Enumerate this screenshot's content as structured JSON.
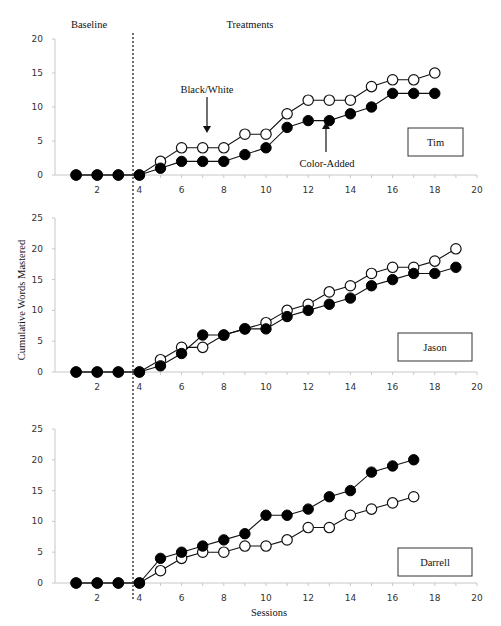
{
  "phase_labels": {
    "baseline": "Baseline",
    "treatments": "Treatments"
  },
  "y_axis_label": "Cumulative Words Mastered",
  "x_axis_label": "Sessions",
  "annotations": {
    "black_white": "Black/White",
    "color_added": "Color-Added"
  },
  "phase_change_after_session": 3.5,
  "colors": {
    "line": "#111111",
    "filled_marker": "#000000",
    "open_marker": "#ffffff",
    "axis": "#c8c8c8"
  },
  "chart_data": [
    {
      "type": "line",
      "title": "Tim",
      "xlabel": "",
      "ylabel": "",
      "xlim": [
        0,
        20
      ],
      "ylim": [
        0,
        20
      ],
      "xticks": [
        2,
        4,
        6,
        8,
        10,
        12,
        14,
        16,
        18,
        20
      ],
      "yticks": [
        0,
        5,
        10,
        15,
        20
      ],
      "grid": false,
      "series": [
        {
          "name": "Black/White",
          "marker": "open",
          "x": [
            1,
            2,
            3,
            4,
            5,
            6,
            7,
            8,
            9,
            10,
            11,
            12,
            13,
            14,
            15,
            16,
            17,
            18
          ],
          "values": [
            0,
            0,
            0,
            0,
            2,
            4,
            4,
            4,
            6,
            6,
            9,
            11,
            11,
            11,
            13,
            14,
            14,
            15
          ]
        },
        {
          "name": "Color-Added",
          "marker": "filled",
          "x": [
            1,
            2,
            3,
            4,
            5,
            6,
            7,
            8,
            9,
            10,
            11,
            12,
            13,
            14,
            15,
            16,
            17,
            18
          ],
          "values": [
            0,
            0,
            0,
            0,
            1,
            2,
            2,
            2,
            3,
            4,
            7,
            8,
            8,
            9,
            10,
            12,
            12,
            12
          ]
        }
      ]
    },
    {
      "type": "line",
      "title": "Jason",
      "xlabel": "",
      "ylabel": "Cumulative Words Mastered",
      "xlim": [
        0,
        20
      ],
      "ylim": [
        0,
        25
      ],
      "xticks": [
        2,
        4,
        6,
        8,
        10,
        12,
        14,
        16,
        18,
        20
      ],
      "yticks": [
        0,
        5,
        10,
        15,
        20,
        25
      ],
      "grid": false,
      "series": [
        {
          "name": "Black/White",
          "marker": "open",
          "x": [
            1,
            2,
            3,
            4,
            5,
            6,
            7,
            8,
            9,
            10,
            11,
            12,
            13,
            14,
            15,
            16,
            17,
            18,
            19
          ],
          "values": [
            0,
            0,
            0,
            0,
            2,
            4,
            4,
            6,
            7,
            8,
            10,
            11,
            13,
            14,
            16,
            17,
            17,
            18,
            20
          ]
        },
        {
          "name": "Color-Added",
          "marker": "filled",
          "x": [
            1,
            2,
            3,
            4,
            5,
            6,
            7,
            8,
            9,
            10,
            11,
            12,
            13,
            14,
            15,
            16,
            17,
            18,
            19
          ],
          "values": [
            0,
            0,
            0,
            0,
            1,
            3,
            6,
            6,
            7,
            7,
            9,
            10,
            11,
            12,
            14,
            15,
            16,
            16,
            17
          ]
        }
      ]
    },
    {
      "type": "line",
      "title": "Darrell",
      "xlabel": "Sessions",
      "ylabel": "",
      "xlim": [
        0,
        20
      ],
      "ylim": [
        0,
        25
      ],
      "xticks": [
        2,
        4,
        6,
        8,
        10,
        12,
        14,
        16,
        18,
        20
      ],
      "yticks": [
        0,
        5,
        10,
        15,
        20,
        25
      ],
      "grid": false,
      "series": [
        {
          "name": "Black/White",
          "marker": "open",
          "x": [
            1,
            2,
            3,
            4,
            5,
            6,
            7,
            8,
            9,
            10,
            11,
            12,
            13,
            14,
            15,
            16,
            17
          ],
          "values": [
            0,
            0,
            0,
            0,
            2,
            4,
            5,
            5,
            6,
            6,
            7,
            9,
            9,
            11,
            12,
            13,
            14
          ]
        },
        {
          "name": "Color-Added",
          "marker": "filled",
          "x": [
            1,
            2,
            3,
            4,
            5,
            6,
            7,
            8,
            9,
            10,
            11,
            12,
            13,
            14,
            15,
            16,
            17
          ],
          "values": [
            0,
            0,
            0,
            0,
            4,
            5,
            6,
            7,
            8,
            11,
            11,
            12,
            14,
            15,
            18,
            19,
            20
          ]
        }
      ]
    }
  ],
  "layout": {
    "panels": [
      {
        "x0": 55,
        "x1": 477,
        "y0": 175,
        "y1": 39,
        "box": [
          408,
          128,
          55,
          28
        ],
        "tick_label_y": 193
      },
      {
        "x0": 55,
        "x1": 477,
        "y0": 372,
        "y1": 218,
        "box": [
          398,
          333,
          74,
          28
        ],
        "tick_label_y": 390
      },
      {
        "x0": 55,
        "x1": 477,
        "y0": 583,
        "y1": 429,
        "box": [
          398,
          548,
          74,
          28
        ],
        "tick_label_y": 601
      }
    ]
  }
}
